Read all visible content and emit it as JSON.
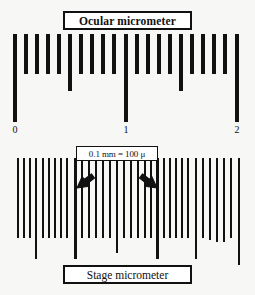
{
  "figure": {
    "background_color": "#f7f7f5",
    "ink_color": "#111111",
    "caption_box_fill": "#ffffff"
  },
  "ocular": {
    "title": "Ocular micrometer",
    "axis_labels": [
      {
        "text": "0",
        "x": 15
      },
      {
        "text": "1",
        "x": 126
      },
      {
        "text": "2",
        "x": 237
      }
    ],
    "ticks": [
      {
        "x": 15,
        "h": 88,
        "w": 4.2
      },
      {
        "x": 26,
        "h": 40,
        "w": 4.2
      },
      {
        "x": 37,
        "h": 40,
        "w": 4.2
      },
      {
        "x": 48,
        "h": 40,
        "w": 4.2
      },
      {
        "x": 59,
        "h": 40,
        "w": 4.2
      },
      {
        "x": 70,
        "h": 57,
        "w": 4.2
      },
      {
        "x": 81,
        "h": 40,
        "w": 4.2
      },
      {
        "x": 92,
        "h": 40,
        "w": 4.2
      },
      {
        "x": 103,
        "h": 40,
        "w": 4.2
      },
      {
        "x": 114,
        "h": 40,
        "w": 4.2
      },
      {
        "x": 126,
        "h": 88,
        "w": 4.2
      },
      {
        "x": 137,
        "h": 40,
        "w": 4.2
      },
      {
        "x": 148,
        "h": 40,
        "w": 4.2
      },
      {
        "x": 159,
        "h": 40,
        "w": 4.2
      },
      {
        "x": 170,
        "h": 40,
        "w": 4.2
      },
      {
        "x": 181,
        "h": 57,
        "w": 4.2
      },
      {
        "x": 192,
        "h": 40,
        "w": 4.2
      },
      {
        "x": 203,
        "h": 40,
        "w": 4.2
      },
      {
        "x": 214,
        "h": 40,
        "w": 4.2
      },
      {
        "x": 225,
        "h": 40,
        "w": 4.2
      },
      {
        "x": 237,
        "h": 88,
        "w": 4.2
      }
    ]
  },
  "stage": {
    "title": "Stage micrometer",
    "callout": "0.1 mm = 100 μ",
    "arrow_left": {
      "from_x": 93,
      "from_y": 18,
      "to_x": 77,
      "to_y": 30
    },
    "arrow_right": {
      "from_x": 141,
      "from_y": 18,
      "to_x": 157,
      "to_y": 30
    },
    "ticks": [
      {
        "x": 18,
        "h": 80,
        "w": 2.8
      },
      {
        "x": 24,
        "h": 80,
        "w": 2.8
      },
      {
        "x": 30,
        "h": 80,
        "w": 2.8
      },
      {
        "x": 36,
        "h": 101,
        "w": 2.8
      },
      {
        "x": 43,
        "h": 80,
        "w": 2.8
      },
      {
        "x": 49,
        "h": 80,
        "w": 2.8
      },
      {
        "x": 55,
        "h": 80,
        "w": 2.8
      },
      {
        "x": 61,
        "h": 80,
        "w": 2.8
      },
      {
        "x": 67,
        "h": 80,
        "w": 2.8
      },
      {
        "x": 75,
        "h": 101,
        "w": 3.0
      },
      {
        "x": 82,
        "h": 80,
        "w": 2.8
      },
      {
        "x": 89,
        "h": 80,
        "w": 2.8
      },
      {
        "x": 96,
        "h": 80,
        "w": 2.8
      },
      {
        "x": 103,
        "h": 80,
        "w": 2.8
      },
      {
        "x": 110,
        "h": 80,
        "w": 2.8
      },
      {
        "x": 117,
        "h": 95,
        "w": 2.8
      },
      {
        "x": 124,
        "h": 80,
        "w": 2.8
      },
      {
        "x": 131,
        "h": 80,
        "w": 2.8
      },
      {
        "x": 138,
        "h": 80,
        "w": 2.8
      },
      {
        "x": 145,
        "h": 80,
        "w": 2.8
      },
      {
        "x": 151,
        "h": 80,
        "w": 2.8
      },
      {
        "x": 157,
        "h": 101,
        "w": 3.0
      },
      {
        "x": 164,
        "h": 80,
        "w": 2.8
      },
      {
        "x": 170,
        "h": 80,
        "w": 2.8
      },
      {
        "x": 176,
        "h": 80,
        "w": 2.8
      },
      {
        "x": 182,
        "h": 80,
        "w": 2.8
      },
      {
        "x": 188,
        "h": 80,
        "w": 2.8
      },
      {
        "x": 196,
        "h": 101,
        "w": 2.8
      },
      {
        "x": 203,
        "h": 80,
        "w": 2.8
      },
      {
        "x": 210,
        "h": 82,
        "w": 2.8
      },
      {
        "x": 217,
        "h": 84,
        "w": 2.8
      },
      {
        "x": 224,
        "h": 84,
        "w": 2.8
      },
      {
        "x": 231,
        "h": 80,
        "w": 2.8
      },
      {
        "x": 239,
        "h": 107,
        "w": 2.8
      }
    ]
  }
}
